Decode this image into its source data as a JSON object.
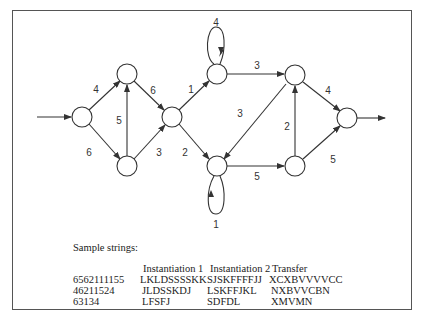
{
  "diagram": {
    "nodes": [
      {
        "id": "n1",
        "x": 82,
        "y": 117
      },
      {
        "id": "n2",
        "x": 127,
        "y": 74
      },
      {
        "id": "n3",
        "x": 127,
        "y": 166
      },
      {
        "id": "n4",
        "x": 172,
        "y": 117
      },
      {
        "id": "n5",
        "x": 217,
        "y": 74
      },
      {
        "id": "n6",
        "x": 217,
        "y": 166
      },
      {
        "id": "n7",
        "x": 295,
        "y": 75
      },
      {
        "id": "n8",
        "x": 295,
        "y": 166
      },
      {
        "id": "n9",
        "x": 347,
        "y": 118
      }
    ],
    "edges": [
      {
        "from": "n1",
        "to": "n2",
        "weight": "4"
      },
      {
        "from": "n1",
        "to": "n3",
        "weight": "6"
      },
      {
        "from": "n3",
        "to": "n2",
        "weight": "5"
      },
      {
        "from": "n2",
        "to": "n4",
        "weight": "6"
      },
      {
        "from": "n3",
        "to": "n4",
        "weight": "3"
      },
      {
        "from": "n4",
        "to": "n5",
        "weight": "1"
      },
      {
        "from": "n4",
        "to": "n6",
        "weight": "2"
      },
      {
        "from": "n5",
        "to": "n5",
        "weight": "4"
      },
      {
        "from": "n6",
        "to": "n6",
        "weight": "1"
      },
      {
        "from": "n5",
        "to": "n7",
        "weight": "3"
      },
      {
        "from": "n7",
        "to": "n6",
        "weight": "3"
      },
      {
        "from": "n6",
        "to": "n8",
        "weight": "5"
      },
      {
        "from": "n8",
        "to": "n7",
        "weight": "2"
      },
      {
        "from": "n7",
        "to": "n9",
        "weight": "4"
      },
      {
        "from": "n8",
        "to": "n9",
        "weight": "5"
      }
    ],
    "labels": {
      "e_n1_n2": "4",
      "e_n1_n3": "6",
      "e_n3_n2": "5",
      "e_n2_n4": "6",
      "e_n3_n4": "3",
      "e_n4_n5": "1",
      "e_n4_n6": "2",
      "loop_n5": "4",
      "loop_n6": "1",
      "e_n5_n7": "3",
      "e_n7_n6": "3",
      "e_n6_n8": "5",
      "e_n8_n7": "2",
      "e_n7_n9": "4",
      "e_n8_n9": "5"
    }
  },
  "samples": {
    "title": "Sample strings:",
    "headers": [
      "",
      "Instantiation 1",
      "Instantiation 2",
      "Transfer"
    ],
    "rows": [
      [
        "6562111155",
        "LKLDSSSSKK",
        "SJSKFFFFJJ",
        "XCXBVVVVCC"
      ],
      [
        "46211524",
        "JLDSSKDJ",
        "LSKFFJKL",
        "NXBVVCBN"
      ],
      [
        "63134",
        "LFSFJ",
        "SDFDL",
        "XMVMN"
      ]
    ]
  }
}
